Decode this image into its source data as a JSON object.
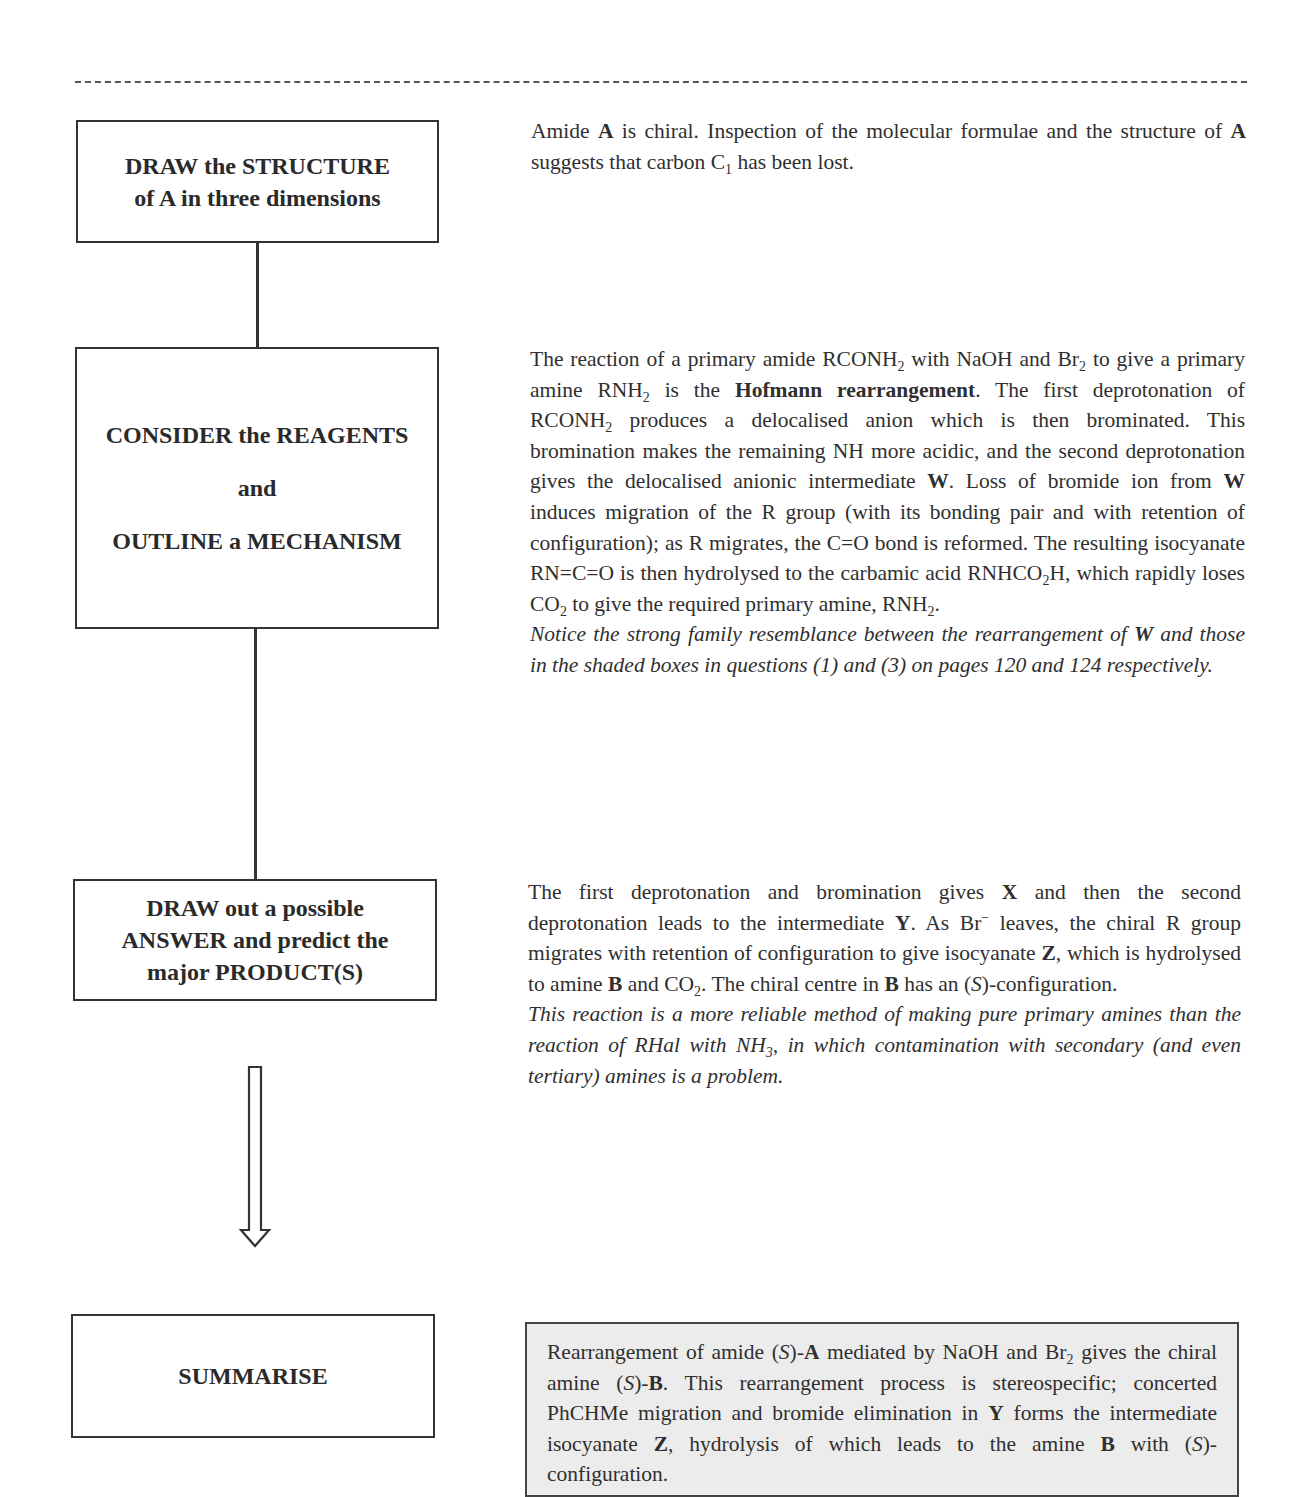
{
  "flowchart": {
    "steps": [
      {
        "lines": [
          "DRAW the STRUCTURE",
          "of A in three dimensions"
        ]
      },
      {
        "lines": [
          "CONSIDER the REAGENTS",
          "and",
          "OUTLINE a MECHANISM"
        ]
      },
      {
        "lines": [
          "DRAW out a possible",
          "ANSWER and predict the",
          "major PRODUCT(S)"
        ]
      },
      {
        "lines": [
          "SUMMARISE"
        ]
      }
    ]
  },
  "sections": {
    "structure": {
      "text_1": "Amide ",
      "bold_A": "A",
      "text_2": " is chiral. Inspection of the molecular formulae and the structure of ",
      "bold_A2": "A",
      "text_3": " suggests that carbon C",
      "sub_1": "1",
      "text_4": " has been lost."
    },
    "mechanism": {
      "t1": "The reaction of a primary amide RCONH",
      "s1": "2",
      "t2": " with NaOH and Br",
      "s2": "2",
      "t3": " to give a primary amine RNH",
      "s3": "2",
      "t4": " is the ",
      "bold_hofmann": "Hofmann rearrangement",
      "t5": ". The first deprotonation of RCONH",
      "s4": "2",
      "t6": " produces a delocalised anion which is then brominated. This bromination makes the remaining NH more acidic, and the second deprotonation gives the delocalised anionic intermediate ",
      "bW1": "W",
      "t7": ". Loss of bromide ion from ",
      "bW2": "W",
      "t8": " induces migration of the R group (with its bonding pair and with retention of configuration); as R migrates, the C=O bond is reformed. The resulting isocyanate RN=C=O is then hydrolysed to the carbamic acid RNHCO",
      "s5": "2",
      "t9": "H, which rapidly loses CO",
      "s6": "2",
      "t10": " to give the required primary amine, RNH",
      "s7": "2",
      "t11": ".",
      "note_1": "Notice the strong family resemblance between the rearrangement of ",
      "note_bW": "W",
      "note_2": " and those in the shaded boxes in questions (1) and (3) on pages 120 and 124 respectively."
    },
    "answer": {
      "t1": "The first deprotonation and bromination gives ",
      "bX": "X",
      "t2": " and then the second deprotonation leads to the intermediate ",
      "bY": "Y",
      "t3": ". As Br",
      "sup_minus": "−",
      "t4": " leaves, the chiral R group migrates with retention of configuration to give isocyanate ",
      "bZ": "Z",
      "t5": ", which is hydrolysed to amine ",
      "bB1": "B",
      "t6": " and CO",
      "s1": "2",
      "t7": ". The chiral centre in ",
      "bB2": "B",
      "t8": " has an (",
      "iS": "S",
      "t9": ")-configuration.",
      "note_1": "This reaction is a more reliable method of making pure primary amines than the reaction of RHal with NH",
      "note_sub": "3",
      "note_2": ", in which contamination with secondary (and even tertiary) amines is a problem."
    },
    "summary": {
      "t1": "Rearrangement of amide (",
      "iS1": "S",
      "t2": ")-",
      "bA": "A",
      "t3": " mediated by NaOH and Br",
      "s1": "2",
      "t4": " gives the chiral amine (",
      "iS2": "S",
      "t5": ")-",
      "bB1": "B",
      "t6": ". This rearrangement process is stereospecific; concerted PhCHMe migration and bromide elimination in ",
      "bY": "Y",
      "t7": " forms the intermediate isocyanate ",
      "bZ": "Z",
      "t8": ", hydrolysis of which leads to the amine ",
      "bB2": "B",
      "t9": " with (",
      "iS3": "S",
      "t10": ")-configuration."
    }
  },
  "colors": {
    "summary_background": "#ececec",
    "border": "#333333",
    "text": "#2f2f2f"
  }
}
